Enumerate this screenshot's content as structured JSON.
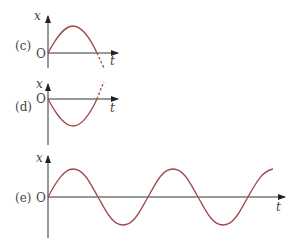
{
  "figure": {
    "panels": [
      {
        "id": "c",
        "label": "(c)",
        "origin_label": "O",
        "y_axis_label": "x",
        "x_axis_label": "t",
        "description": "starts at 0, rises to positive peak, returns to 0, continues (dashed) below"
      },
      {
        "id": "d",
        "label": "(d)",
        "origin_label": "O",
        "y_axis_label": "x",
        "x_axis_label": "t",
        "description": "starts at 0, falls to negative trough, returns to 0, continues (dashed) above"
      },
      {
        "id": "e",
        "label": "(e)",
        "origin_label": "O",
        "y_axis_label": "x",
        "x_axis_label": "t",
        "description": "sine wave over ~2.25 periods"
      }
    ],
    "curve_color": "#a0484d",
    "axis_color": "#333333"
  }
}
